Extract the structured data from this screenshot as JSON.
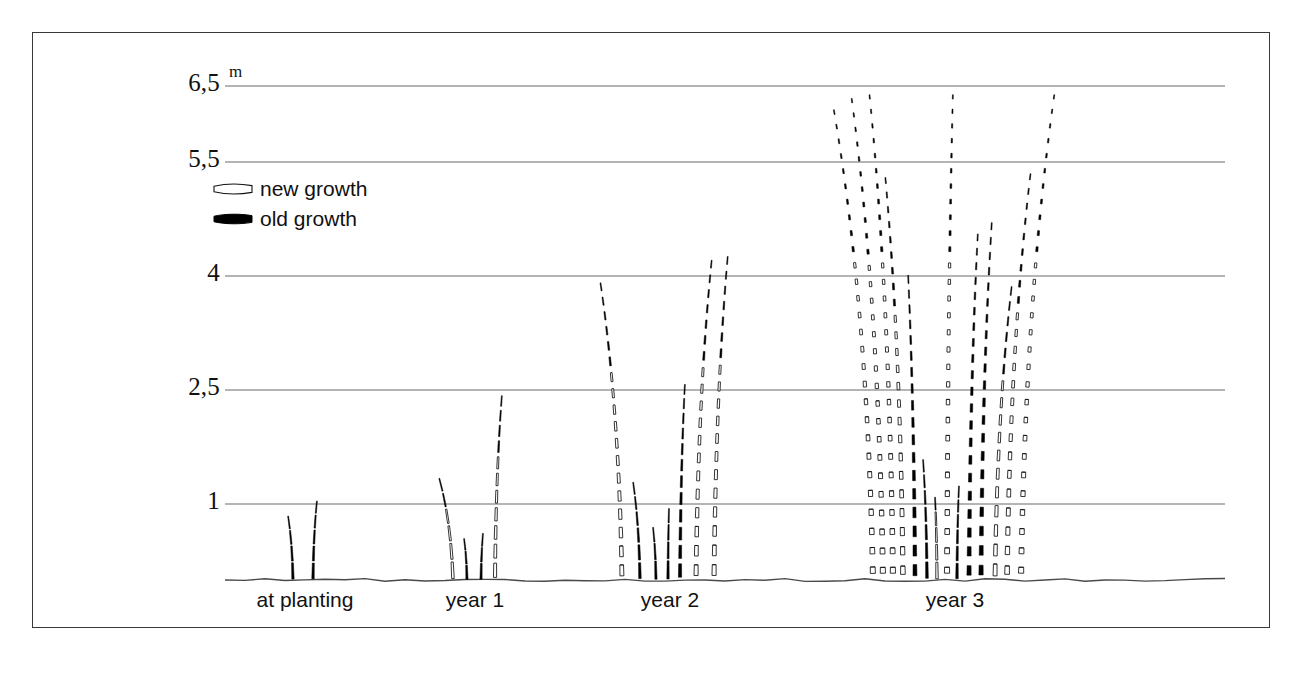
{
  "figure": {
    "unit_label": "m",
    "y_axis": {
      "ticks": [
        "6,5",
        "5,5",
        "4",
        "2,5",
        "1"
      ],
      "tick_values": [
        6.5,
        5.5,
        4,
        2.5,
        1
      ],
      "baseline_value": 0
    },
    "legend": {
      "items": [
        {
          "key": "new",
          "label": "new growth",
          "swatch": "culm-outline-icon",
          "color": "#ffffff",
          "stroke": "#111111"
        },
        {
          "key": "old",
          "label": "old growth",
          "swatch": "culm-solid-icon",
          "color": "#000000",
          "stroke": "#000000"
        }
      ]
    },
    "x_axis": {
      "categories": [
        "at planting",
        "year 1",
        "year 2",
        "year 3"
      ]
    },
    "colors": {
      "frame": "#3a3a3a",
      "gridline": "#6b6b6b",
      "ground": "#4a4a4a",
      "old_growth": "#000000",
      "new_growth_fill": "#ffffff",
      "new_growth_stroke": "#111111",
      "background": "#ffffff"
    }
  },
  "chart_data": {
    "type": "bar",
    "title": "",
    "subtitle": "",
    "xlabel": "",
    "ylabel": "m",
    "ylim": [
      0,
      6.8
    ],
    "grid": true,
    "gridlines": [
      6.5,
      5.5,
      4,
      2.5,
      1
    ],
    "legend_position": "upper-left",
    "categories": [
      "at planting",
      "year 1",
      "year 2",
      "year 3"
    ],
    "series": [
      {
        "name": "old growth",
        "values": [
          0.85,
          0.6,
          1.15,
          4.1
        ]
      },
      {
        "name": "new growth",
        "values": [
          1.05,
          2.45,
          4.3,
          6.5
        ]
      }
    ],
    "culm_counts": [
      2,
      4,
      7,
      14
    ],
    "max_height_m": [
      1.05,
      2.45,
      4.3,
      6.5
    ],
    "groups": [
      {
        "label": "at planting",
        "culms": [
          {
            "type": "old",
            "height_m": 0.85,
            "base_offset": -12,
            "lean": -5
          },
          {
            "type": "old",
            "height_m": 1.05,
            "base_offset": 8,
            "lean": 4
          }
        ]
      },
      {
        "label": "year 1",
        "culms": [
          {
            "type": "new",
            "height_m": 1.35,
            "base_offset": -22,
            "lean": -14
          },
          {
            "type": "old",
            "height_m": 0.55,
            "base_offset": -8,
            "lean": -3
          },
          {
            "type": "old",
            "height_m": 0.62,
            "base_offset": 6,
            "lean": 2
          },
          {
            "type": "new",
            "height_m": 2.45,
            "base_offset": 20,
            "lean": 7
          }
        ]
      },
      {
        "label": "year 2",
        "culms": [
          {
            "type": "new",
            "height_m": 3.95,
            "base_offset": -48,
            "lean": -22
          },
          {
            "type": "old",
            "height_m": 1.3,
            "base_offset": -30,
            "lean": -7
          },
          {
            "type": "old",
            "height_m": 0.7,
            "base_offset": -14,
            "lean": -3
          },
          {
            "type": "old",
            "height_m": 0.95,
            "base_offset": -2,
            "lean": 1
          },
          {
            "type": "old",
            "height_m": 2.6,
            "base_offset": 10,
            "lean": 5
          },
          {
            "type": "new",
            "height_m": 4.25,
            "base_offset": 26,
            "lean": 16
          },
          {
            "type": "new",
            "height_m": 4.3,
            "base_offset": 44,
            "lean": 14
          }
        ]
      },
      {
        "label": "year 3",
        "culms": [
          {
            "type": "new",
            "height_m": 6.25,
            "base_offset": -82,
            "lean": -40
          },
          {
            "type": "new",
            "height_m": 6.4,
            "base_offset": -72,
            "lean": -32
          },
          {
            "type": "new",
            "height_m": 6.45,
            "base_offset": -62,
            "lean": -24
          },
          {
            "type": "new",
            "height_m": 5.35,
            "base_offset": -52,
            "lean": -18
          },
          {
            "type": "old",
            "height_m": 4.05,
            "base_offset": -40,
            "lean": -7
          },
          {
            "type": "old",
            "height_m": 1.6,
            "base_offset": -28,
            "lean": -4
          },
          {
            "type": "new",
            "height_m": 1.1,
            "base_offset": -18,
            "lean": -2
          },
          {
            "type": "new",
            "height_m": 6.45,
            "base_offset": -8,
            "lean": 6
          },
          {
            "type": "old",
            "height_m": 1.25,
            "base_offset": 2,
            "lean": 2
          },
          {
            "type": "old",
            "height_m": 4.6,
            "base_offset": 14,
            "lean": 9
          },
          {
            "type": "old",
            "height_m": 4.75,
            "base_offset": 26,
            "lean": 11
          },
          {
            "type": "new",
            "height_m": 3.9,
            "base_offset": 40,
            "lean": 17
          },
          {
            "type": "new",
            "height_m": 5.4,
            "base_offset": 52,
            "lean": 24
          },
          {
            "type": "new",
            "height_m": 6.45,
            "base_offset": 66,
            "lean": 34
          }
        ]
      }
    ]
  }
}
